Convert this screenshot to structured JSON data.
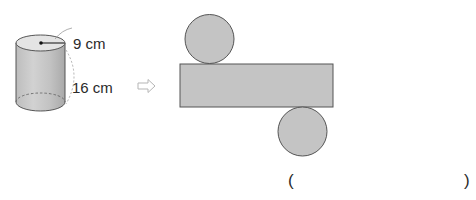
{
  "cylinder": {
    "radius_label": "9 cm",
    "height_label": "16 cm",
    "radius_value": 9,
    "height_value": 16,
    "unit": "cm"
  },
  "arrow": {
    "icon": "hollow-right-arrow-icon",
    "color": "#b5b5b5"
  },
  "net": {
    "fill_color": "#c4c4c4",
    "stroke_color": "#555555",
    "parts": [
      "top-circle",
      "lateral-rectangle",
      "bottom-circle"
    ]
  },
  "answer": {
    "open_paren": "(",
    "close_paren": ")",
    "value": ""
  }
}
